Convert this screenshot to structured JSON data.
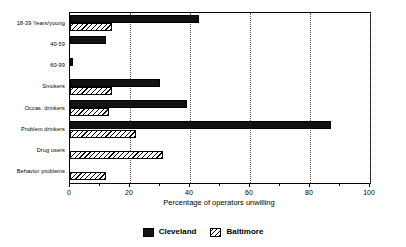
{
  "chart_data": {
    "type": "bar",
    "orientation": "horizontal",
    "title": "",
    "subtitle": "",
    "xlabel": "Percentage of operators unwilling",
    "ylabel": "",
    "xlim": [
      0,
      100
    ],
    "xticks": [
      0,
      20,
      40,
      60,
      80,
      100
    ],
    "xtick_labels": [
      "0",
      "20",
      "40",
      "60",
      "80",
      "100"
    ],
    "minor_xticks": [
      10,
      30,
      50,
      70,
      90
    ],
    "grid": "vertical-dotted-at-major-ticks",
    "legend_position": "bottom-center",
    "categories": [
      "18-39 Years/young",
      "40-59",
      "60-99",
      "Smokers",
      "Occas. drinkers",
      "Problem drinkers",
      "Drug users",
      "Behavior problems"
    ],
    "series": [
      {
        "name": "Cleveland",
        "color": "#111111",
        "pattern": "solid",
        "values": [
          43,
          12,
          1,
          30,
          39,
          87,
          0,
          0
        ]
      },
      {
        "name": "Baltimore",
        "color": "#ffffff",
        "pattern": "diagonal-hatch",
        "values": [
          14,
          0,
          0,
          14,
          13,
          22,
          31,
          12
        ]
      }
    ]
  },
  "legend": {
    "items": [
      {
        "label": "Cleveland",
        "swatch": "solid-black-square"
      },
      {
        "label": "Baltimore",
        "swatch": "hatched-square"
      }
    ]
  },
  "axis": {
    "x_title": "Percentage of operators unwilling",
    "x_tick_labels": [
      "0",
      "20",
      "40",
      "60",
      "80",
      "100"
    ]
  }
}
